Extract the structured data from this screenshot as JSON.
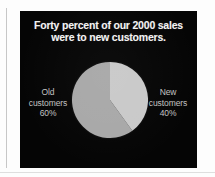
{
  "slide": {
    "background_color": "#050505",
    "title": {
      "line1": "Forty percent of our 2000 sales",
      "line2": "were to new customers.",
      "color": "#f2f2f2"
    },
    "labels": {
      "old": {
        "name": "Old",
        "qualifier": "customers",
        "percent": "60%",
        "color": "#c2c2c2"
      },
      "new": {
        "name": "New",
        "qualifier": "customers",
        "percent": "40%",
        "color": "#c2c2c2"
      }
    }
  },
  "chart_data": {
    "type": "pie",
    "title": "Forty percent of our 2000 sales were to new customers.",
    "categories": [
      "Old customers",
      "New customers"
    ],
    "values": [
      60,
      40
    ],
    "value_labels": [
      "60%",
      "40%"
    ],
    "unit": "percent",
    "total": 100,
    "start_angle_deg": 0,
    "direction": "clockwise",
    "legend": "none",
    "labels_position": "outside-left-and-right",
    "colors": [
      "#a8a8a8",
      "#c9c9c9"
    ],
    "slices": [
      {
        "name": "Old customers",
        "value": 60,
        "label": "60%",
        "color": "#a8a8a8",
        "start_deg": 144,
        "end_deg": 360
      },
      {
        "name": "New customers",
        "value": 40,
        "label": "40%",
        "color": "#c9c9c9",
        "start_deg": 0,
        "end_deg": 144
      }
    ]
  }
}
